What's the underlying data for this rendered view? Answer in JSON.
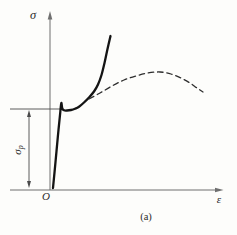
{
  "figure": {
    "caption": "(a)",
    "labels": {
      "y_axis": "σ",
      "x_axis": "ε",
      "origin": "O",
      "sigma_p_main": "σ",
      "sigma_p_sub": "p"
    },
    "colors": {
      "curve": "#141414",
      "dashed_curve": "#2e2e2e",
      "axis": "#6f6f6f",
      "annotation": "#4a4a4a",
      "text": "#2b2b2b",
      "background": "#fdfdfb"
    }
  },
  "chart_data": {
    "type": "line",
    "xlabel": "ε",
    "ylabel": "σ",
    "axis_ranges": "qualitative — no numeric scale or tick labels shown",
    "grid": false,
    "legend": "none",
    "annotations": [
      "σp — dimension arrow on the left marking the stress level of the proportional limit (horizontal reference line drawn from the yield region to the σ axis)",
      "(a) — sub-figure caption below the ε axis"
    ],
    "series": [
      {
        "name": "solid-curve",
        "style": "solid",
        "width": 2.3,
        "points_px": [
          [
            53,
            188
          ],
          [
            55.5,
            162
          ],
          [
            58,
            135
          ],
          [
            60.3,
            112
          ],
          [
            61.3,
            103
          ],
          [
            62.3,
            108.5
          ],
          [
            64,
            110.3
          ],
          [
            67,
            110.5
          ],
          [
            71,
            110
          ],
          [
            75,
            108.8
          ],
          [
            79,
            106.8
          ],
          [
            84,
            102.5
          ],
          [
            89,
            97.5
          ],
          [
            94,
            91.5
          ],
          [
            98,
            84.5
          ],
          [
            101.5,
            75
          ],
          [
            104.5,
            63
          ],
          [
            107.5,
            49
          ],
          [
            110.5,
            36
          ]
        ]
      },
      {
        "name": "dashed-curve",
        "style": "dashed",
        "width": 1.3,
        "dash": "5.5 3.8",
        "points_px": [
          [
            89,
            99
          ],
          [
            100,
            93
          ],
          [
            112,
            86
          ],
          [
            124,
            80
          ],
          [
            136,
            76
          ],
          [
            148,
            73
          ],
          [
            160,
            72
          ],
          [
            171,
            74
          ],
          [
            181,
            78
          ],
          [
            190,
            83
          ],
          [
            197,
            88
          ],
          [
            203,
            92
          ]
        ]
      }
    ]
  }
}
